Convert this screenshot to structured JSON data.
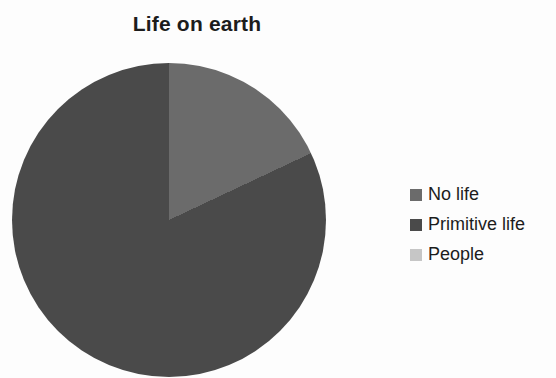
{
  "chart_data": {
    "type": "pie",
    "title": "Life on earth",
    "categories": [
      "No life",
      "Primitive life",
      "People"
    ],
    "values": [
      18,
      82,
      0
    ],
    "unit": "percent (estimated from slice angles; People slice too small to be visible)",
    "colors": [
      "#6b6b6b",
      "#4a4a4a",
      "#c6c6c6"
    ],
    "start_angle_deg": 0,
    "direction": "clockwise",
    "legend_position": "right",
    "data_labels": false,
    "grid": false
  },
  "title": {
    "text": "Life on earth",
    "color": "#1c1c1c"
  },
  "legend": {
    "items": [
      {
        "label": "No life",
        "color": "#6b6b6b"
      },
      {
        "label": "Primitive life",
        "color": "#4a4a4a"
      },
      {
        "label": "People",
        "color": "#c6c6c6"
      }
    ],
    "text_color": "#1c1c1c"
  },
  "colors": {
    "background": "#fdfdfd"
  }
}
